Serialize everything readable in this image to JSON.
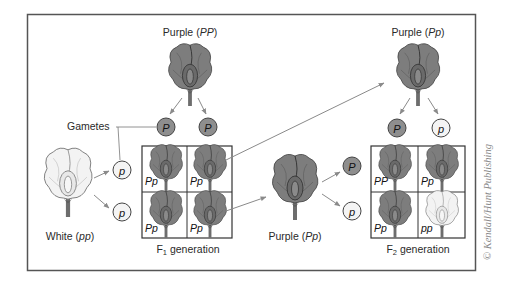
{
  "figure": {
    "type": "monohybrid-cross-punnett",
    "colors": {
      "frame": "#555555",
      "arrow": "#8a8a8a",
      "purple_flower_fill": "#7a7a7a",
      "white_flower_fill": "#f2f2f2",
      "dominant_gamete_fill": "#8e8e8e",
      "recessive_gamete_fill": "#f4f4f4"
    },
    "parents": {
      "purple": {
        "label": "Purple",
        "genotype": "PP"
      },
      "white": {
        "label": "White",
        "genotype": "pp"
      }
    },
    "gametes_label": "Gametes",
    "parent_gametes": {
      "purple": [
        "P",
        "P"
      ],
      "white": [
        "p",
        "p"
      ]
    },
    "f1": {
      "label_prefix": "F",
      "label_sub": "1",
      "label_suffix": " generation",
      "cells": [
        "Pp",
        "Pp",
        "Pp",
        "Pp"
      ]
    },
    "f1_selected": [
      {
        "label": "Purple",
        "genotype": "Pp",
        "gametes_role": "top"
      },
      {
        "label": "Purple",
        "genotype": "Pp",
        "gametes_role": "left"
      }
    ],
    "f1_parent_top_gametes": [
      "P",
      "p"
    ],
    "f1_parent_left_gametes": [
      "P",
      "p"
    ],
    "f2": {
      "label_prefix": "F",
      "label_sub": "2",
      "label_suffix": " generation",
      "cells": [
        "PP",
        "Pp",
        "Pp",
        "pp"
      ]
    },
    "copyright": "© Kendall/Hunt Publishing"
  }
}
